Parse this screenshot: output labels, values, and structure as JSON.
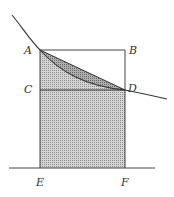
{
  "diagram": {
    "type": "geometry",
    "labels": {
      "A": "A",
      "B": "B",
      "C": "C",
      "D": "D",
      "E": "E",
      "F": "F"
    },
    "points": {
      "A": [
        40,
        50
      ],
      "B": [
        125,
        50
      ],
      "C": [
        40,
        90
      ],
      "D": [
        125,
        90
      ],
      "E": [
        40,
        168
      ],
      "F": [
        125,
        168
      ]
    },
    "curve": {
      "start": [
        12,
        15
      ],
      "through_A": [
        40,
        50
      ],
      "through_D": [
        125,
        90
      ],
      "end": [
        167,
        99
      ]
    },
    "baseline": {
      "x1": 9,
      "x2": 155,
      "y": 168
    },
    "colors": {
      "line": "#333333",
      "fill_light": "#c8c8c8",
      "fill_dark": "#a8a8a8"
    }
  }
}
